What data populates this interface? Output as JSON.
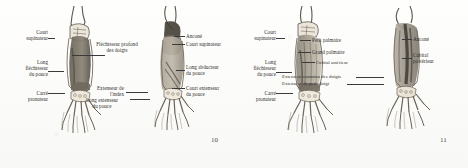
{
  "document": {
    "kind": "anatomy-plate-scan",
    "language": "French",
    "subject": "Muscles de l'avant-bras et de la main",
    "colors": {
      "paper": "#fdfdfb",
      "ink": "#2e2e2e",
      "leader": "#3a3a3a",
      "bone": "#f1ece2",
      "bone_outline": "#6b6355",
      "muscle_light": "#b9b2a4",
      "muscle_mid": "#8e8madd",
      "muscle_dark": "#4f4a42"
    }
  },
  "pages": [
    {
      "folio": "10"
    },
    {
      "folio": "11"
    }
  ],
  "figures": [
    {
      "id": "fig-1",
      "view": "anterior-deep-left-forearm",
      "labels_left": [
        {
          "id": "f1-court-supinateur",
          "lines": [
            "Court",
            "supinateur"
          ]
        },
        {
          "id": "f1-long-flechisseur",
          "lines": [
            "Long",
            "fléchisseur",
            "du pouce"
          ]
        },
        {
          "id": "f1-carre-pronateur",
          "lines": [
            "Carré",
            "pronateur"
          ]
        }
      ],
      "labels_right": [
        {
          "id": "f1-flechisseur-profond",
          "lines": [
            "Fléchisseur profond",
            "des doigts"
          ]
        }
      ]
    },
    {
      "id": "fig-2",
      "view": "posterior-deep-left-forearm",
      "labels_left": [
        {
          "id": "f2-extenseur-index",
          "lines": [
            "Extenseur de",
            "l'index"
          ]
        },
        {
          "id": "f2-long-extenseur",
          "lines": [
            "Long extenseur",
            "du pouce"
          ]
        }
      ],
      "labels_right": [
        {
          "id": "f2-ancone",
          "lines": [
            "Anconé"
          ]
        },
        {
          "id": "f2-court-supinateur",
          "lines": [
            "Court supinateur"
          ]
        },
        {
          "id": "f2-long-abducteur",
          "lines": [
            "Long abducteur",
            "du pouce"
          ]
        },
        {
          "id": "f2-court-extenseur",
          "lines": [
            "Court extenseur",
            "du pouce"
          ]
        }
      ]
    },
    {
      "id": "fig-3",
      "view": "anterior-superficial-left-forearm",
      "labels_left": [
        {
          "id": "f3-court-supinateur",
          "lines": [
            "Court",
            "supinateur"
          ]
        },
        {
          "id": "f3-long-flechisseur",
          "lines": [
            "Long",
            "fléchisseur",
            "du pouce"
          ]
        },
        {
          "id": "f3-carre-pronateur",
          "lines": [
            "Carré",
            "pronateur"
          ]
        }
      ],
      "labels_right": [
        {
          "id": "f3-petit-palmaire",
          "lines": [
            "Petit palmaire"
          ]
        },
        {
          "id": "f3-grand-palmaire",
          "lines": [
            "Grand palmaire"
          ]
        },
        {
          "id": "f3-cubital-anterieur",
          "lines": [
            "Cubital antérieur"
          ]
        },
        {
          "id": "f3-extenseur-commun",
          "lines": [
            "Extenseur commun des doigts"
          ]
        },
        {
          "id": "f3-extenseur-petit",
          "lines": [
            "Extenseur du petit doigt"
          ]
        }
      ]
    },
    {
      "id": "fig-4",
      "view": "posterior-superficial-left-forearm",
      "labels_right": [
        {
          "id": "f4-ancone",
          "lines": [
            "Anconé"
          ]
        },
        {
          "id": "f4-cubital-posterieur",
          "lines": [
            "Cubital",
            "postérieur"
          ]
        }
      ]
    }
  ]
}
